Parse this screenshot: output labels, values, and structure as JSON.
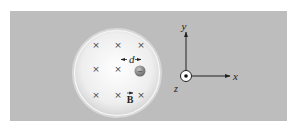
{
  "figure": {
    "field_label": "B",
    "field_symbol": "×",
    "field_direction": "into-page",
    "spacing_label": "d",
    "particle_charge_sign": "−",
    "field_marks": {
      "rows": 3,
      "cols": 3,
      "missing": []
    },
    "axes": {
      "x_label": "x",
      "y_label": "y",
      "z_label": "z",
      "z_direction": "out-of-page"
    },
    "colors": {
      "panel": "#bdbdbd",
      "disk": "#f2f2f2",
      "disk_rim": "#e0e0e0",
      "particle": "#8a8a8a",
      "ink": "#222222"
    }
  }
}
